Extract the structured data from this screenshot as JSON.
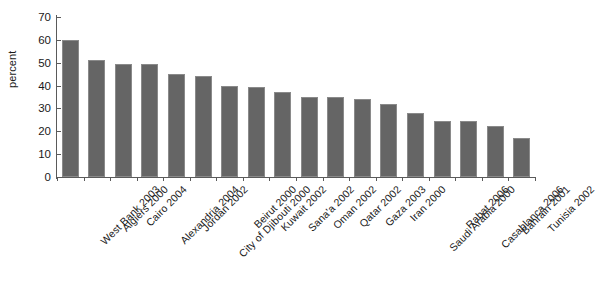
{
  "chart_data": {
    "type": "bar",
    "title": "",
    "xlabel": "",
    "ylabel": "percent",
    "ylim": [
      0,
      70
    ],
    "yticks": [
      0,
      10,
      20,
      30,
      40,
      50,
      60,
      70
    ],
    "grid": false,
    "legend": null,
    "bar_color": "#656565",
    "categories": [
      "West Bank 2003",
      "Algiers 2000",
      "Cairo 2004",
      "Alexandria 2004",
      "Jordan 2002",
      "City of Djibouti 2000",
      "Beirut 2000",
      "Kuwait 2002",
      "Sana'a 2002",
      "Oman 2002",
      "Qatar 2002",
      "Gaza 2003",
      "Iran 2000",
      "Saudi Arabia 2000",
      "Rabat 2006",
      "Casablanca 2006",
      "Bahrain 2001",
      "Tunisia 2002"
    ],
    "values": [
      60,
      51,
      49.5,
      49.5,
      45,
      44,
      40,
      39.5,
      37,
      35,
      35,
      34,
      32,
      28,
      24.5,
      24.5,
      22.5,
      17
    ]
  }
}
